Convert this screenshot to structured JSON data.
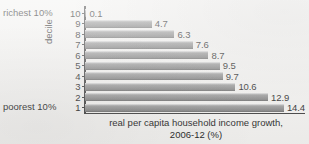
{
  "chart_data": {
    "type": "bar",
    "orientation": "horizontal",
    "title": "",
    "xlabel": "real per capita household income growth, 2006-12 (%)",
    "ylabel": "decile",
    "categories": [
      "10",
      "9",
      "8",
      "7",
      "6",
      "5",
      "4",
      "3",
      "2",
      "1"
    ],
    "values": [
      0.1,
      4.7,
      6.3,
      7.6,
      8.7,
      9.5,
      9.7,
      10.6,
      12.9,
      14.4
    ],
    "value_labels": [
      "0.1",
      "4.7",
      "6.3",
      "7.6",
      "8.7",
      "9.5",
      "9.7",
      "10.6",
      "12.9",
      "14.4"
    ],
    "xlim": [
      0,
      15.5
    ],
    "grid": false,
    "legend": false,
    "annotations": [
      {
        "text": "richest 10%",
        "category": "10"
      },
      {
        "text": "poorest 10%",
        "category": "1"
      }
    ],
    "bar_color": "#8d8d8d",
    "axis_color": "#3a3a3a",
    "background_color": "#f3f2f0"
  },
  "axis": {
    "y_title": "decile",
    "caption_line1": "real per capita household income growth,",
    "caption_line2": "2006-12 (%)"
  },
  "annotations": {
    "richest": "richest 10%",
    "poorest": "poorest 10%"
  }
}
